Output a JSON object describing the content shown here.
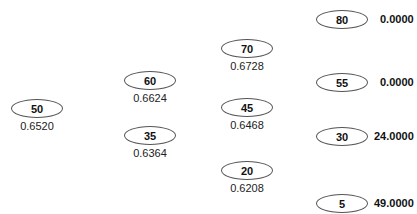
{
  "tree": {
    "levels": [
      [
        {
          "value": "50",
          "prob": "0.6520"
        }
      ],
      [
        {
          "value": "60",
          "prob": "0.6624"
        },
        {
          "value": "35",
          "prob": "0.6364"
        }
      ],
      [
        {
          "value": "70",
          "prob": "0.6728"
        },
        {
          "value": "45",
          "prob": "0.6468"
        },
        {
          "value": "20",
          "prob": "0.6208"
        }
      ],
      [
        {
          "value": "80",
          "payoff": "0.0000"
        },
        {
          "value": "55",
          "payoff": "0.0000"
        },
        {
          "value": "30",
          "payoff": "24.0000"
        },
        {
          "value": "5",
          "payoff": "49.0000"
        }
      ]
    ]
  }
}
